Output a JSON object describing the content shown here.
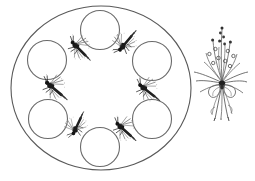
{
  "illustration": {
    "title": "Line drawing of a round tray with seven circular wells, six bees, and a flower bouquet",
    "background_color": "#ffffff",
    "ink_color": "#4a4a4a",
    "ink_color_dark": "#2b2b2b",
    "canvas": {
      "width": 255,
      "height": 181
    }
  },
  "tray": {
    "label": "Large round tray outline",
    "center_x": 101,
    "center_y": 88,
    "radius_x": 90,
    "radius_y": 82,
    "stroke_color": "#595959",
    "stroke_width": 1.1,
    "fill": "none"
  },
  "wells": {
    "label": "Circular wells arranged in a ring",
    "count": 7,
    "radius": 19.5,
    "stroke_color": "#6b6b6b",
    "stroke_width": 1.1,
    "fill": "none",
    "items": [
      {
        "name": "well-top",
        "cx": 100,
        "cy": 30,
        "angle_deg": 270
      },
      {
        "name": "well-upper-right",
        "cx": 152,
        "cy": 61,
        "angle_deg": 330
      },
      {
        "name": "well-lower-right",
        "cx": 152,
        "cy": 119,
        "angle_deg": 30
      },
      {
        "name": "well-bottom",
        "cx": 100,
        "cy": 147,
        "angle_deg": 90
      },
      {
        "name": "well-lower-left",
        "cx": 48,
        "cy": 119,
        "angle_deg": 150
      },
      {
        "name": "well-upper-left",
        "cx": 47,
        "cy": 60,
        "angle_deg": 210
      },
      {
        "name": "well-left-center",
        "cx": 47,
        "cy": 60,
        "angle_deg": 210
      }
    ]
  },
  "bees": {
    "label": "Small bee and insect drawings between the wells",
    "count": 6,
    "body_color": "#1f1f1f",
    "wing_color": "#8c8c8c",
    "items": [
      {
        "name": "bee-upper-left",
        "x": 77,
        "y": 47,
        "rotation_deg": 25,
        "scale": 1.0
      },
      {
        "name": "bee-top-right",
        "x": 124,
        "y": 45,
        "rotation_deg": -70,
        "scale": 1.0
      },
      {
        "name": "bee-left",
        "x": 52,
        "y": 87,
        "rotation_deg": 20,
        "scale": 1.05
      },
      {
        "name": "bee-right",
        "x": 145,
        "y": 89,
        "rotation_deg": 18,
        "scale": 1.0
      },
      {
        "name": "bee-bottom-left",
        "x": 76,
        "y": 128,
        "rotation_deg": -85,
        "scale": 0.95
      },
      {
        "name": "bee-bottom-right",
        "x": 122,
        "y": 128,
        "rotation_deg": 22,
        "scale": 1.0
      }
    ]
  },
  "bouquet": {
    "label": "Flower bouquet tied with a ribbon bow",
    "name": "flower-bouquet",
    "center_x": 222,
    "top_y": 38,
    "bottom_y": 132,
    "stem_color": "#595959",
    "bud_color": "#3a3a3a",
    "ribbon_color": "#6b6b6b",
    "flower_spray_count": 5,
    "bud_count": 14,
    "leaf_count": 8,
    "ribbon_tail_count": 3
  }
}
